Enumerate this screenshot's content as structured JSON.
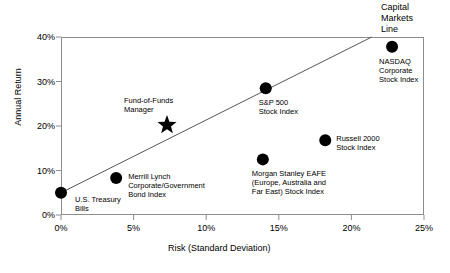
{
  "chart_data": {
    "type": "scatter",
    "title": "",
    "xlabel": "Risk (Standard Deviation)",
    "ylabel": "Annual Return",
    "xlim": [
      0,
      25
    ],
    "ylim": [
      0,
      40
    ],
    "xticks": [
      "0%",
      "5%",
      "10%",
      "15%",
      "20%",
      "25%"
    ],
    "xtick_values": [
      0,
      5,
      10,
      15,
      20,
      25
    ],
    "yticks": [
      "0%",
      "10%",
      "20%",
      "30%",
      "40%"
    ],
    "ytick_values": [
      0,
      10,
      20,
      30,
      40
    ],
    "grid": false,
    "legend": "none",
    "points": [
      {
        "name": "U.S. Treasury Bills",
        "label": "U.S. Treasury\nBills",
        "x": 0.0,
        "y": 5.0,
        "marker": "circle",
        "label_dx": 14,
        "label_dy": 2
      },
      {
        "name": "Merrill Lynch Corporate/Government Bond Index",
        "label": "Merrill Lynch\nCorporate/Government\nBond Index",
        "x": 3.8,
        "y": 8.3,
        "marker": "circle",
        "label_dx": 12,
        "label_dy": -6
      },
      {
        "name": "Fund-of-Funds Manager",
        "label": "Fund-of-Funds\nManager",
        "x": 7.3,
        "y": 20.2,
        "marker": "star",
        "label_dx": -43,
        "label_dy": -29
      },
      {
        "name": "Morgan Stanley EAFE (Europe, Australia and Far East) Stock Index",
        "label": "Morgan Stanley EAFE\n(Europe, Australia and\nFar East) Stock Index",
        "x": 13.9,
        "y": 12.5,
        "marker": "circle",
        "label_dx": -11,
        "label_dy": 10
      },
      {
        "name": "S&P 500 Stock Index",
        "label": "S&P 500\nStock Index",
        "x": 14.1,
        "y": 28.5,
        "marker": "circle",
        "label_dx": -7,
        "label_dy": 10
      },
      {
        "name": "Russell 2000 Stock Index",
        "label": "Russell 2000\nStock Index",
        "x": 18.2,
        "y": 16.8,
        "marker": "circle",
        "label_dx": 11,
        "label_dy": -6
      },
      {
        "name": "NASDAQ Corporate Stock Index",
        "label": "NASDAQ\nCorporate\nStock Index",
        "x": 22.8,
        "y": 37.8,
        "marker": "circle",
        "label_dx": -13,
        "label_dy": 10
      }
    ],
    "lines": [
      {
        "name": "Capital Markets Line",
        "label": "Capital\nMarkets\nLine",
        "x0": 0.0,
        "y0": 5.0,
        "x1": 21.4,
        "y1": 40.0
      }
    ],
    "annotations": [
      {
        "name": "capital-markets-line-label",
        "text": "Capital\nMarkets\nLine",
        "left": 381,
        "top": 2
      }
    ],
    "colors": {
      "marker": "#000000",
      "line": "#555555",
      "axis": "#8d8d8d",
      "text": "#000000",
      "background": "#ffffff"
    }
  }
}
